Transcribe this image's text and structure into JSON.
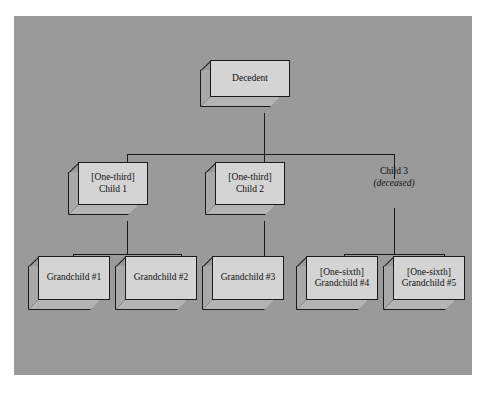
{
  "diagram": {
    "background_color": "#9a9a9a",
    "box_face_color": "#d4d4d4",
    "line_color": "#1b1b1b",
    "nodes": {
      "decedent": {
        "line1": "Decedent",
        "line2": ""
      },
      "child1": {
        "line1": "[One-third]",
        "line2": "Child 1"
      },
      "child2": {
        "line1": "[One-third]",
        "line2": "Child 2"
      },
      "child3": {
        "line1": "Child 3",
        "line2": "(deceased)"
      },
      "grandchild1": {
        "line1": "Grandchild #1",
        "line2": ""
      },
      "grandchild2": {
        "line1": "Grandchild #2",
        "line2": ""
      },
      "grandchild3": {
        "line1": "Grandchild #3",
        "line2": ""
      },
      "grandchild4": {
        "line1": "[One-sixth]",
        "line2": "Grandchild #4"
      },
      "grandchild5": {
        "line1": "[One-sixth]",
        "line2": "Grandchild #5"
      }
    }
  }
}
